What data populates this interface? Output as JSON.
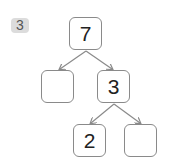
{
  "problem": {
    "number": "3"
  },
  "tree": {
    "root": {
      "value": "7"
    },
    "level1": [
      {
        "value": ""
      },
      {
        "value": "3"
      }
    ],
    "level2": [
      {
        "value": "2"
      },
      {
        "value": ""
      }
    ]
  },
  "colors": {
    "border": "#8a8a8a",
    "badge_bg": "#dcdcdc",
    "arrow": "#8a8a8a"
  }
}
